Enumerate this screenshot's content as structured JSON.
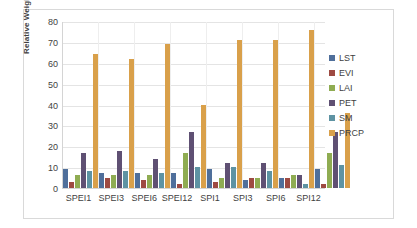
{
  "chart_data": {
    "type": "bar",
    "title": "",
    "xlabel": "",
    "ylabel": "Relative Weight (%)",
    "ylim": [
      0,
      80
    ],
    "ytick_step": 10,
    "yticks": [
      0,
      10,
      20,
      30,
      40,
      50,
      60,
      70,
      80
    ],
    "grid": true,
    "legend_position": "right",
    "categories": [
      "SPEI1",
      "SPEI3",
      "SPEI6",
      "SPEI12",
      "SPI1",
      "SPI3",
      "SPI6",
      "SPI12"
    ],
    "series": [
      {
        "name": "LST",
        "color": "#4f6f9b",
        "values": [
          9,
          7,
          7,
          7,
          9,
          4,
          5,
          9
        ]
      },
      {
        "name": "EVI",
        "color": "#9e4a42",
        "values": [
          3,
          5,
          4,
          2,
          3,
          5,
          5,
          2
        ]
      },
      {
        "name": "LAI",
        "color": "#8ba martins",
        "values": [
          6,
          6,
          6,
          17,
          5,
          5,
          6,
          17
        ]
      },
      {
        "name": "PET",
        "color": "#5f5073",
        "values": [
          17,
          17.5,
          14,
          27,
          12,
          12,
          6,
          27
        ]
      },
      {
        "name": "SM",
        "color": "#5e93a3",
        "values": [
          8,
          8,
          7,
          10,
          10,
          8,
          2,
          11
        ]
      },
      {
        "name": "PRCP",
        "color": "#d9a04a",
        "values": [
          64,
          62,
          69,
          40,
          71,
          71,
          75.5,
          36
        ]
      }
    ]
  },
  "legend": {
    "items": [
      "LST",
      "EVI",
      "LAI",
      "PET",
      "SM",
      "PRCP"
    ]
  }
}
